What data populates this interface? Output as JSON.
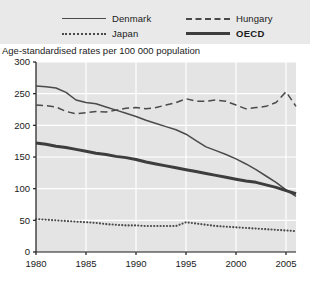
{
  "legend": {
    "items": [
      {
        "label": "Denmark",
        "style": "solid",
        "bold": false,
        "col": 0,
        "row": 0
      },
      {
        "label": "Hungary",
        "style": "dashed",
        "bold": false,
        "col": 1,
        "row": 0
      },
      {
        "label": "Japan",
        "style": "dotted",
        "bold": false,
        "col": 0,
        "row": 1
      },
      {
        "label": "OECD",
        "style": "thick",
        "bold": true,
        "col": 1,
        "row": 1
      }
    ]
  },
  "axis_caption": "Age-standardised rates per 100 000 population",
  "colors": {
    "plot_background": "#e4e4e4",
    "gridline": "#ffffff",
    "axis": "#1b1b1b",
    "series_line": "#4a4a4a",
    "series_thick": "#3d3d3d"
  },
  "chart_data": {
    "type": "line",
    "title": "",
    "subtitle": "",
    "xlabel": "",
    "ylabel": "Age-standardised rates per 100 000 population",
    "xlim": [
      1980,
      2006
    ],
    "ylim": [
      0,
      300
    ],
    "yticks": [
      0,
      50,
      100,
      150,
      200,
      250,
      300
    ],
    "xticks": [
      1980,
      1985,
      1990,
      1995,
      2000,
      2005
    ],
    "grid": true,
    "legend_position": "top",
    "x": [
      1980,
      1981,
      1982,
      1983,
      1984,
      1985,
      1986,
      1987,
      1988,
      1989,
      1990,
      1991,
      1992,
      1993,
      1994,
      1995,
      1996,
      1997,
      1998,
      1999,
      2000,
      2001,
      2002,
      2003,
      2004,
      2005,
      2006
    ],
    "series": [
      {
        "name": "Denmark",
        "style": "solid",
        "values": [
          262,
          261,
          259,
          252,
          240,
          236,
          234,
          229,
          224,
          219,
          214,
          208,
          203,
          198,
          193,
          186,
          176,
          166,
          160,
          154,
          147,
          139,
          130,
          120,
          110,
          98,
          88
        ]
      },
      {
        "name": "Hungary",
        "style": "dashed",
        "values": [
          232,
          231,
          229,
          222,
          218,
          220,
          222,
          221,
          224,
          227,
          228,
          226,
          228,
          232,
          236,
          242,
          238,
          238,
          240,
          238,
          232,
          226,
          228,
          230,
          236,
          253,
          230
        ]
      },
      {
        "name": "Japan",
        "style": "dotted",
        "values": [
          52,
          51,
          50,
          49,
          48,
          47,
          46,
          44,
          43,
          42,
          42,
          41,
          41,
          41,
          41,
          47,
          45,
          43,
          41,
          40,
          39,
          38,
          37,
          36,
          35,
          34,
          33
        ]
      },
      {
        "name": "OECD",
        "style": "thick",
        "values": [
          172,
          170,
          167,
          165,
          162,
          159,
          156,
          154,
          151,
          149,
          146,
          142,
          139,
          136,
          133,
          130,
          127,
          124,
          121,
          118,
          115,
          112,
          110,
          106,
          102,
          97,
          92
        ]
      }
    ]
  }
}
